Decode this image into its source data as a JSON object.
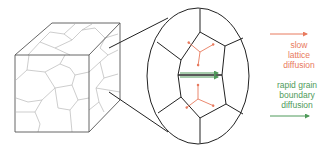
{
  "diagram": {
    "legend": {
      "slow": {
        "lines": [
          "slow",
          "lattice",
          "diffusion"
        ],
        "color": "#e87a5e",
        "arrow_icon": "right-arrow-icon"
      },
      "rapid": {
        "lines": [
          "rapid grain",
          "boundary",
          "diffusion"
        ],
        "color": "#4f9a5a",
        "arrow_icon": "right-arrow-icon"
      }
    },
    "colors": {
      "outline": "#222222",
      "grain_boundaries": "#b5b5b5",
      "lattice_arrows": "#e87a5e",
      "boundary_arrows": "#4f9a5a"
    }
  }
}
